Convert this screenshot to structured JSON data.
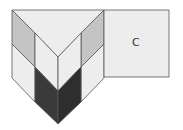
{
  "diagram": {
    "label_square": "C",
    "colors": {
      "light": "#ededed",
      "gray": "#c4c4c4",
      "dark": "#3a3a3a",
      "stroke": "#555555"
    }
  }
}
